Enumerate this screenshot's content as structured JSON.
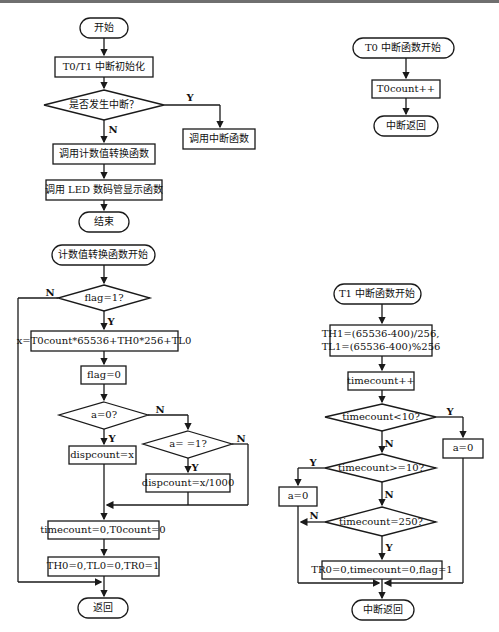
{
  "main_flow": {
    "start": "开始",
    "init": "T0/T1 中断初始化",
    "decision": "是否发生中断？",
    "yes_branch": "调用中断函数",
    "call_convert": "调用计数值转换函数",
    "call_display": "调用 LED 数码管显示函数",
    "end": "结束",
    "labels": {
      "y": "Y",
      "n": "N"
    }
  },
  "t0_flow": {
    "start": "T0 中断函数开始",
    "step": "T0count++",
    "end": "中断返回"
  },
  "convert_flow": {
    "start": "计数值转换函数开始",
    "decision_flag": "flag=1?",
    "calc": "x=T0count*65536+TH0*256+TL0",
    "reset_flag": "flag=0",
    "decision_a0": "a=0?",
    "disp_x": "dispcount=x",
    "decision_a1": "a= =1?",
    "disp_x1000": "dispcount=x/1000",
    "reset_counts": "timecount=0,T0count=0",
    "reset_timer": "TH0=0,TL0=0,TR0=1",
    "end": "返回",
    "labels": {
      "y": "Y",
      "n": "N"
    }
  },
  "t1_flow": {
    "start": "T1 中断函数开始",
    "reload": "TH1=(65536-400)/256,\nTL1=(65536-400)%256",
    "inc": "timecount++",
    "decision_lt10": "timecount<10?",
    "a0_right": "a=0",
    "decision_ge10": "timecount>=10?",
    "a0_left": "a=0",
    "decision_250": "timecount=250?",
    "final": "TR0=0,timecount=0,flag=1",
    "end": "中断返回",
    "labels": {
      "y": "Y",
      "n": "N"
    }
  },
  "colors": {
    "line": "#1a1a1a",
    "background": "#ffffff"
  }
}
